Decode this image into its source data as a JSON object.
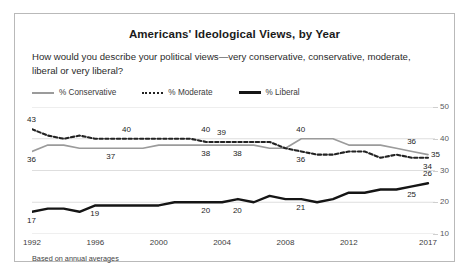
{
  "card": {
    "title": "Americans' Ideological Views, by Year",
    "subtitle": "How would you describe your political views—very conservative, conservative, moderate, liberal or very liberal?",
    "source_note": "Based on annual averages"
  },
  "legend": [
    {
      "key": "conservative",
      "label": "% Conservative",
      "style": "solid",
      "color": "#9b9b9b"
    },
    {
      "key": "moderate",
      "label": "% Moderate",
      "style": "dotted",
      "color": "#222222"
    },
    {
      "key": "liberal",
      "label": "% Liberal",
      "style": "bold-solid",
      "color": "#151515"
    }
  ],
  "chart_data": {
    "type": "line",
    "title": "Americans' Ideological Views, by Year",
    "subtitle": "How would you describe your political views—very conservative, conservative, moderate, liberal or very liberal?",
    "xlabel": "",
    "ylabel": "",
    "ylim": [
      10,
      50
    ],
    "yticks": [
      10,
      20,
      30,
      40,
      50
    ],
    "ytick_labels": [
      "10",
      "20",
      "30",
      "40",
      "50"
    ],
    "y_axis_position": "right",
    "grid": true,
    "legend_position": "top-left",
    "xlim": [
      1992,
      2017
    ],
    "x": [
      1992,
      1993,
      1994,
      1995,
      1996,
      1997,
      1998,
      1999,
      2000,
      2001,
      2002,
      2003,
      2004,
      2005,
      2006,
      2007,
      2008,
      2009,
      2010,
      2011,
      2012,
      2013,
      2014,
      2015,
      2016,
      2017
    ],
    "xticks": [
      1992,
      1996,
      2000,
      2004,
      2008,
      2012,
      2017
    ],
    "xtick_labels": [
      "1992",
      "1996",
      "2000",
      "2004",
      "2008",
      "2012",
      "2017"
    ],
    "series": [
      {
        "name": "% Conservative",
        "color": "#9b9b9b",
        "style": "solid",
        "values": [
          36,
          38,
          38,
          37,
          37,
          37,
          37,
          37,
          38,
          38,
          38,
          38,
          38,
          38,
          38,
          37,
          37,
          40,
          40,
          40,
          38,
          38,
          38,
          37,
          36,
          35
        ]
      },
      {
        "name": "% Moderate",
        "color": "#222222",
        "style": "dotted",
        "values": [
          43,
          41,
          40,
          41,
          40,
          40,
          40,
          40,
          40,
          40,
          40,
          39,
          39,
          39,
          39,
          39,
          37,
          36,
          35,
          35,
          36,
          36,
          34,
          35,
          34,
          34
        ]
      },
      {
        "name": "% Liberal",
        "color": "#151515",
        "style": "bold-solid",
        "values": [
          17,
          18,
          18,
          17,
          19,
          19,
          19,
          19,
          19,
          20,
          20,
          20,
          20,
          21,
          20,
          22,
          21,
          21,
          20,
          21,
          23,
          23,
          24,
          24,
          25,
          26
        ]
      }
    ],
    "point_labels": [
      {
        "series": "% Moderate",
        "year": 1992,
        "value": 43,
        "text": "43",
        "position": "above"
      },
      {
        "series": "% Conservative",
        "year": 1992,
        "value": 36,
        "text": "36",
        "position": "below"
      },
      {
        "series": "% Liberal",
        "year": 1992,
        "value": 17,
        "text": "17",
        "position": "below"
      },
      {
        "series": "% Moderate",
        "year": 1998,
        "value": 40,
        "text": "40",
        "position": "above"
      },
      {
        "series": "% Conservative",
        "year": 1997,
        "value": 37,
        "text": "37",
        "position": "below"
      },
      {
        "series": "% Liberal",
        "year": 1996,
        "value": 19,
        "text": "19",
        "position": "below"
      },
      {
        "series": "% Conservative",
        "year": 2003,
        "value": 40,
        "text": "40",
        "position": "above"
      },
      {
        "series": "% Moderate",
        "year": 2004,
        "value": 39,
        "text": "39",
        "position": "above"
      },
      {
        "series": "% Conservative",
        "year": 2003,
        "value": 38,
        "text": "38",
        "position": "below"
      },
      {
        "series": "% Moderate",
        "year": 2005,
        "value": 38,
        "text": "38",
        "position": "below"
      },
      {
        "series": "% Liberal",
        "year": 2003,
        "value": 20,
        "text": "20",
        "position": "below"
      },
      {
        "series": "% Liberal",
        "year": 2005,
        "value": 20,
        "text": "20",
        "position": "below"
      },
      {
        "series": "% Conservative",
        "year": 2009,
        "value": 40,
        "text": "40",
        "position": "above"
      },
      {
        "series": "% Moderate",
        "year": 2009,
        "value": 36,
        "text": "36",
        "position": "below"
      },
      {
        "series": "% Liberal",
        "year": 2009,
        "value": 21,
        "text": "21",
        "position": "below"
      },
      {
        "series": "% Conservative",
        "year": 2016,
        "value": 36,
        "text": "36",
        "position": "above"
      },
      {
        "series": "% Conservative",
        "year": 2017,
        "value": 35,
        "text": "35",
        "position": "right"
      },
      {
        "series": "% Moderate",
        "year": 2017,
        "value": 34,
        "text": "34",
        "position": "below"
      },
      {
        "series": "% Liberal",
        "year": 2016,
        "value": 25,
        "text": "25",
        "position": "below"
      },
      {
        "series": "% Liberal",
        "year": 2017,
        "value": 26,
        "text": "26",
        "position": "above"
      }
    ]
  }
}
